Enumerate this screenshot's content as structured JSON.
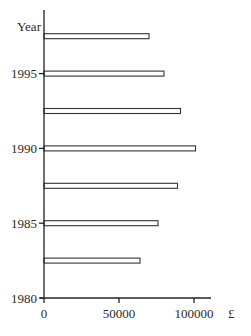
{
  "chart_data": {
    "type": "bar",
    "orientation": "horizontal",
    "title": "",
    "xlabel": "£",
    "ylabel": "Year",
    "categories": [
      "1982.5",
      "1985",
      "1987.5",
      "1990",
      "1992.5",
      "1995",
      "1997.5"
    ],
    "values": [
      64000,
      76000,
      89000,
      101000,
      91000,
      80000,
      70000
    ],
    "xlim": [
      0,
      110000
    ],
    "ylim": [
      1980,
      2000
    ],
    "x_ticks": [
      0,
      50000,
      100000
    ],
    "x_tick_labels": [
      "0",
      "50000",
      "100000"
    ],
    "y_ticks": [
      1980,
      1985,
      1990,
      1995
    ],
    "y_tick_labels": [
      "1980",
      "1985",
      "1990",
      "1995"
    ],
    "grid": false,
    "legend": null,
    "bar_style": "outlined"
  }
}
